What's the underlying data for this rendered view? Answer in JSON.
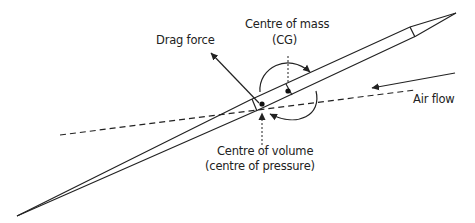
{
  "diagram": {
    "labels": {
      "drag_force": "Drag force",
      "centre_of_mass_line1": "Centre of mass",
      "centre_of_mass_line2": "(CG)",
      "air_flow": "Air flow",
      "centre_of_volume_line1": "Centre of volume",
      "centre_of_volume_line2": "(centre of pressure)"
    },
    "colors": {
      "stroke": "#222222",
      "background": "#ffffff"
    },
    "elements": [
      "rocket-body",
      "centre-of-mass-dot",
      "centre-of-pressure-dot",
      "flight-path-dashed-line",
      "air-flow-arrow",
      "drag-force-arrow",
      "rotation-arrow-top",
      "rotation-arrow-bottom"
    ]
  }
}
